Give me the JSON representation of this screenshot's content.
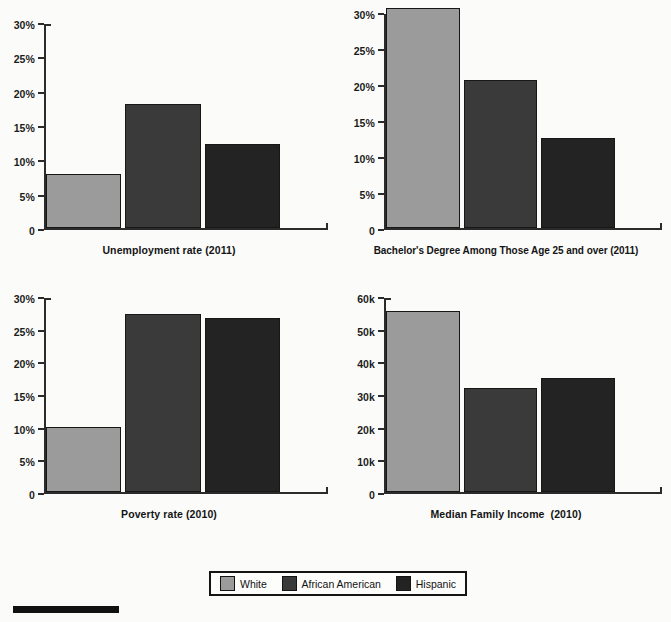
{
  "figure": {
    "legend": {
      "items": [
        {
          "label": "White",
          "color": "#9b9b9b"
        },
        {
          "label": "African American",
          "color": "#3a3a3a"
        },
        {
          "label": "Hispanic",
          "color": "#232323"
        }
      ]
    },
    "top_cropped_text": "",
    "bottom_rule": true
  },
  "chart_data": [
    {
      "type": "bar",
      "title": "Unemployment rate (2011)",
      "xlabel": "",
      "ylabel": "",
      "categories": [
        "White",
        "African American",
        "Hispanic"
      ],
      "values": [
        7.9,
        18.3,
        12.4
      ],
      "value_labels": [
        "7.9%",
        "18.3%",
        "12.4%"
      ],
      "ylim": [
        0,
        30
      ],
      "yticks": [
        0,
        5,
        10,
        15,
        20,
        25,
        30
      ],
      "ytick_labels": [
        "0",
        "5%",
        "10%",
        "15%",
        "20%",
        "25%",
        "30%"
      ],
      "grid": false,
      "legend_position": "figure-bottom"
    },
    {
      "type": "bar",
      "title": "Bachelor's Degree Among Those Age 25 and over (2011)",
      "xlabel": "",
      "ylabel": "",
      "categories": [
        "White",
        "African American",
        "Hispanic"
      ],
      "values": [
        30.9,
        20.8,
        12.6
      ],
      "value_labels": [
        "30.9%",
        "20.8%",
        "12.6%"
      ],
      "ylim": [
        0,
        30
      ],
      "yticks": [
        0,
        5,
        10,
        15,
        20,
        25,
        30
      ],
      "ytick_labels": [
        "0",
        "5%",
        "10%",
        "15%",
        "20%",
        "25%",
        "30%"
      ],
      "grid": false,
      "legend_position": "figure-bottom"
    },
    {
      "type": "bar",
      "title": "Poverty rate (2010)",
      "xlabel": "",
      "ylabel": "",
      "categories": [
        "White",
        "African American",
        "Hispanic"
      ],
      "values": [
        10.0,
        27.6,
        26.9
      ],
      "value_labels": [
        "10.0%",
        "27.6%",
        "26.9%"
      ],
      "ylim": [
        0,
        30
      ],
      "yticks": [
        0,
        5,
        10,
        15,
        20,
        25,
        30
      ],
      "ytick_labels": [
        "0",
        "5%",
        "10%",
        "15%",
        "20%",
        "25%",
        "30%"
      ],
      "grid": false,
      "legend_position": "figure-bottom"
    },
    {
      "type": "bar",
      "title": "Median Family Income  (2010)",
      "xlabel": "",
      "ylabel": "",
      "categories": [
        "White",
        "African American",
        "Hispanic"
      ],
      "values": [
        56000,
        32100,
        35200
      ],
      "value_labels": [
        "56k",
        "32.1k",
        "35.2k"
      ],
      "ylim": [
        0,
        60000
      ],
      "yticks": [
        0,
        10000,
        20000,
        30000,
        40000,
        50000,
        60000
      ],
      "ytick_labels": [
        "0",
        "10k",
        "20k",
        "30k",
        "40k",
        "50k",
        "60k"
      ],
      "grid": false,
      "legend_position": "figure-bottom"
    }
  ]
}
